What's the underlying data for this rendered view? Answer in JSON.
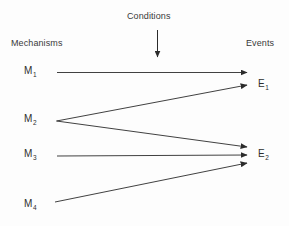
{
  "diagram": {
    "background_color": "#fdfdfd",
    "line_color": "#2b2b2b",
    "text_color": "#3a3a3a",
    "width": 289,
    "height": 226
  },
  "labels": {
    "conditions": "Conditions",
    "mechanisms": "Mechanisms",
    "events": "Events"
  },
  "mechanisms": [
    {
      "id": "M1",
      "base": "M",
      "sub": "1"
    },
    {
      "id": "M2",
      "base": "M",
      "sub": "2"
    },
    {
      "id": "M3",
      "base": "M",
      "sub": "3"
    },
    {
      "id": "M4",
      "base": "M",
      "sub": "4"
    }
  ],
  "events": [
    {
      "id": "E1",
      "base": "E",
      "sub": "1"
    },
    {
      "id": "E2",
      "base": "E",
      "sub": "2"
    }
  ],
  "connections": [
    {
      "name": "m1-to-e1",
      "from": "M1",
      "to": "E1"
    },
    {
      "name": "m2-to-e1",
      "from": "M2",
      "to": "E1"
    },
    {
      "name": "m2-to-e2",
      "from": "M2",
      "to": "E2"
    },
    {
      "name": "m3-to-e2",
      "from": "M3",
      "to": "E2"
    },
    {
      "name": "m4-to-e2",
      "from": "M4",
      "to": "E2"
    },
    {
      "name": "conditions-arrow",
      "from": "Conditions",
      "to": ""
    }
  ]
}
